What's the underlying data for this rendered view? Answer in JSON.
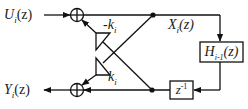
{
  "diagram": {
    "type": "lattice filter section block diagram",
    "input_label": "U_i(z)",
    "output_label": "Y_i(z)",
    "state_label": "X_i(z)",
    "upper_gain": "-k_i",
    "lower_gain": "k_i",
    "filter_block": "H_{i-1}(z)",
    "delay_block": "z^{-1}",
    "colors": {
      "line": "#111111",
      "background": "#ffffff"
    }
  },
  "labels": {
    "input_main": "U",
    "input_sub": "i",
    "input_arg": "(z)",
    "output_main": "Y",
    "output_sub": "i",
    "output_arg": "(z)",
    "state_main": "X",
    "state_sub": "i",
    "state_arg": "(z)",
    "upper_gain_main": "-k",
    "upper_gain_sub": "i",
    "lower_gain_main": "k",
    "lower_gain_sub": "i",
    "filter_main": "H",
    "filter_sub": "i-1",
    "filter_arg": "(z)",
    "delay_main": "z",
    "delay_sup": "-1"
  }
}
